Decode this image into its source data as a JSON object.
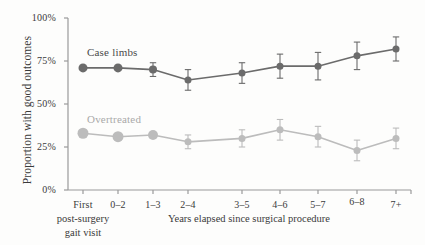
{
  "chart_data": {
    "type": "line",
    "title": "",
    "subtitle": "",
    "xlabel": "Years elapsed since surgical procedure",
    "ylabel": "Proportion with good outcomes",
    "categories": [
      "First",
      "0–2",
      "1–3",
      "2–4",
      "3–5",
      "4–6",
      "5–7",
      "6–8",
      "7+"
    ],
    "first_category_sub_line1": "post-surgery",
    "first_category_sub_line2": "gait visit",
    "ylim": [
      0,
      100
    ],
    "yticks": [
      0,
      25,
      50,
      75,
      100
    ],
    "ytick_labels": [
      "0%",
      "25%",
      "50%",
      "75%",
      "100%"
    ],
    "grid": false,
    "legend_position": "inline-annotation",
    "series": [
      {
        "name": "Case limbs",
        "color": "#6b6b6b",
        "values": [
          71,
          71,
          70,
          64,
          68,
          72,
          72,
          78,
          82
        ],
        "errors": [
          0,
          0,
          4,
          6,
          6,
          7,
          8,
          8,
          7
        ],
        "marker_sizes": [
          9,
          9,
          8,
          7,
          7,
          7,
          7,
          7,
          7
        ],
        "label_x": 9,
        "label_y": 53
      },
      {
        "name": "Overtreated",
        "color": "#bcbcbc",
        "values": [
          33,
          31,
          32,
          28,
          30,
          35,
          31,
          23,
          30
        ],
        "errors": [
          0,
          0,
          0,
          4,
          5,
          6,
          6,
          6,
          6
        ],
        "marker_sizes": [
          11,
          11,
          10,
          7,
          7,
          7,
          7,
          7,
          7
        ],
        "label_x": 9,
        "label_y": 119
      }
    ]
  },
  "axes": {
    "axis_color": "#9a9a9a",
    "text_color": "#3a3a3a"
  }
}
